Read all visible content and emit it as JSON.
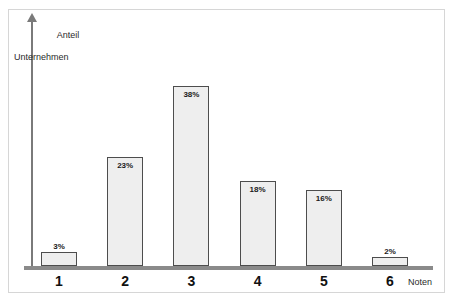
{
  "chart_data": {
    "type": "bar",
    "title": "",
    "xlabel": "Noten",
    "ylabel_line1": "Anteil",
    "ylabel_line2": "Unternehmen",
    "categories": [
      "1",
      "2",
      "3",
      "4",
      "5",
      "6"
    ],
    "values": [
      3,
      23,
      38,
      18,
      16,
      2
    ],
    "value_labels": [
      "3%",
      "23%",
      "38%",
      "18%",
      "16%",
      "2%"
    ],
    "ylim": [
      0,
      44
    ],
    "grid": false,
    "legend": "none",
    "colors": {
      "bar_fill": "#eeeeee",
      "bar_border": "#4d4d4d",
      "axis": "#8a8a8a",
      "text": "#1a1a1a",
      "frame": "#d6d6d6"
    }
  }
}
